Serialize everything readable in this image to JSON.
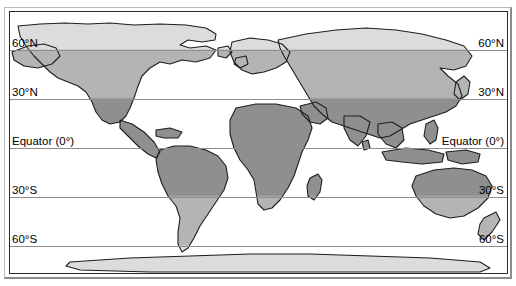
{
  "figure": {
    "kind": "world-map",
    "title": "",
    "projection": "equirectangular"
  },
  "latitude_labels": [
    {
      "id": "lat-60n",
      "text": "60°N",
      "y": 49,
      "value": 60
    },
    {
      "id": "lat-30n",
      "text": "30°N",
      "y": 98,
      "value": 30
    },
    {
      "id": "lat-equator",
      "text": "Equator (0°)",
      "y": 147,
      "value": 0
    },
    {
      "id": "lat-30s",
      "text": "30°S",
      "y": 196,
      "value": -30
    },
    {
      "id": "lat-60s",
      "text": "60°S",
      "y": 245,
      "value": -60
    }
  ],
  "zones": {
    "tropical": {
      "label": "",
      "color": "#8f8f8f"
    },
    "temperate": {
      "label": "",
      "color": "#b4b4b4"
    },
    "polar": {
      "label": "",
      "color": "#dcdcdc"
    }
  },
  "colors": {
    "ocean": "#ffffff",
    "coastline": "#1e1e1e",
    "gridline": "#8e8e8e",
    "map_border": "#2b2b2b",
    "outer_frame_light": "#b9b9b9",
    "outer_frame_dark": "#8c8c8c",
    "text": "#000000"
  }
}
